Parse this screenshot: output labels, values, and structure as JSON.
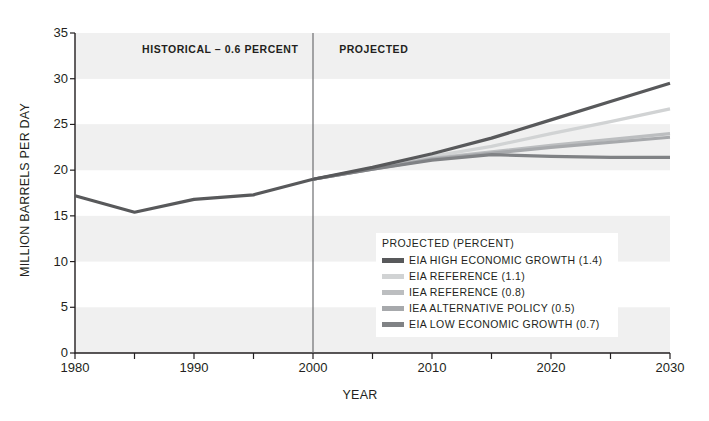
{
  "chart_data": {
    "type": "line",
    "title": "",
    "xlabel": "YEAR",
    "ylabel": "MILLION BARRELS PER DAY",
    "xlim": [
      1980,
      2030
    ],
    "ylim": [
      0,
      35
    ],
    "ytick_values": [
      0,
      5,
      10,
      15,
      20,
      25,
      30,
      35
    ],
    "ytick_labels": [
      "0",
      "5",
      "10",
      "15",
      "20",
      "25",
      "30",
      "35"
    ],
    "xtick_values": [
      1980,
      1990,
      2000,
      2010,
      2020,
      2030
    ],
    "xtick_labels": [
      "1980",
      "1990",
      "2000",
      "2010",
      "2020",
      "2030"
    ],
    "xtick_minor_values": [
      1985,
      1995,
      2005,
      2015,
      2025
    ],
    "grid": "horizontal-bands",
    "band_color": "#f0f0f0",
    "divider_year": 2000,
    "legend_position": "inside-lower-right",
    "annotations": [
      {
        "name": "historical-label",
        "text": "HISTORICAL – 0.6 PERCENT",
        "x_year": 1993.2,
        "y_value": 33.1
      },
      {
        "name": "projected-label",
        "text": "PROJECTED",
        "x_year": 2002.2,
        "y_value": 33.1
      }
    ],
    "legend_title": "PROJECTED (PERCENT)",
    "series": [
      {
        "name": "HISTORICAL",
        "legend": false,
        "color": "#58595b",
        "width": 3.2,
        "x": [
          1980,
          1985,
          1990,
          1995,
          2000
        ],
        "values": [
          17.2,
          15.4,
          16.8,
          17.3,
          19.0
        ]
      },
      {
        "name": "EIA HIGH ECONOMIC GROWTH (1.4)",
        "legend": true,
        "color": "#58595b",
        "width": 3.2,
        "x": [
          2000,
          2005,
          2010,
          2015,
          2020,
          2025,
          2030
        ],
        "values": [
          19.0,
          20.3,
          21.8,
          23.5,
          25.5,
          27.5,
          29.5
        ]
      },
      {
        "name": "EIA REFERENCE (1.1)",
        "legend": true,
        "color": "#d1d3d4",
        "width": 3.2,
        "x": [
          2000,
          2005,
          2010,
          2015,
          2020,
          2025,
          2030
        ],
        "values": [
          19.0,
          20.2,
          21.5,
          22.6,
          24.0,
          25.3,
          26.7
        ]
      },
      {
        "name": "IEA REFERENCE (0.8)",
        "legend": true,
        "color": "#bcbec0",
        "width": 3.2,
        "x": [
          2000,
          2010,
          2020,
          2030
        ],
        "values": [
          19.0,
          21.3,
          22.7,
          24.0
        ]
      },
      {
        "name": "IEA ALTERNATIVE POLICY (0.5)",
        "legend": true,
        "color": "#a7a9ac",
        "width": 3.2,
        "x": [
          2000,
          2010,
          2020,
          2030
        ],
        "values": [
          19.0,
          21.2,
          22.5,
          23.6
        ]
      },
      {
        "name": "EIA LOW ECONOMIC GROWTH (0.7)",
        "legend": true,
        "color": "#808285",
        "width": 3.2,
        "x": [
          2000,
          2005,
          2010,
          2015,
          2020,
          2025,
          2030
        ],
        "values": [
          19.0,
          20.1,
          21.1,
          21.7,
          21.5,
          21.4,
          21.4
        ]
      }
    ]
  }
}
